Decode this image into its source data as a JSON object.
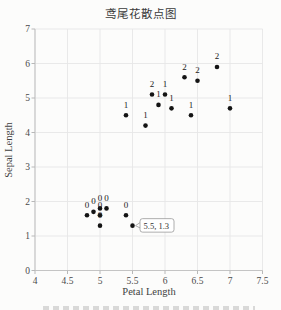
{
  "chart": {
    "title": "鸢尾花散点图",
    "xlabel": "Petal Length",
    "ylabel": "Sepal Length"
  },
  "chart_data": {
    "type": "scatter",
    "title": "鸢尾花散点图",
    "xlabel": "Petal Length",
    "ylabel": "Sepal Length",
    "xlim": [
      4,
      7.5
    ],
    "ylim": [
      0,
      7
    ],
    "xticks": [
      4,
      4.5,
      5,
      5.5,
      6,
      6.5,
      7,
      7.5
    ],
    "yticks": [
      0,
      1,
      2,
      3,
      4,
      5,
      6,
      7
    ],
    "grid": true,
    "legend_position": "none",
    "marker_color": "#141414",
    "grid_color": "#e7e7e7",
    "axis_color": "#c4c4c4",
    "series": [
      {
        "name": "class-0",
        "label": "0",
        "points": [
          [
            4.8,
            1.6
          ],
          [
            4.9,
            1.7
          ],
          [
            5.0,
            1.8
          ],
          [
            5.1,
            1.8
          ],
          [
            5.0,
            1.6
          ],
          [
            5.0,
            1.3
          ],
          [
            5.4,
            1.6
          ],
          [
            5.5,
            1.3
          ]
        ]
      },
      {
        "name": "class-1",
        "label": "1",
        "points": [
          [
            5.4,
            4.5
          ],
          [
            5.7,
            4.2
          ],
          [
            5.9,
            4.8
          ],
          [
            6.0,
            5.1
          ],
          [
            6.1,
            4.7
          ],
          [
            6.4,
            4.5
          ],
          [
            7.0,
            4.7
          ]
        ]
      },
      {
        "name": "class-2",
        "label": "2",
        "points": [
          [
            5.8,
            5.1
          ],
          [
            6.3,
            5.6
          ],
          [
            6.5,
            5.5
          ],
          [
            6.8,
            5.9
          ]
        ]
      }
    ],
    "annotation": {
      "text": "5.5, 1.3",
      "point": [
        5.5,
        1.3
      ]
    }
  }
}
